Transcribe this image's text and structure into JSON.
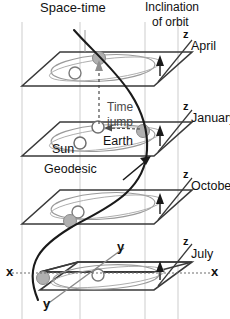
{
  "figure": {
    "background_color": "#ffffff",
    "ink_color": "#1a1a1a",
    "grid_color": "#c9c9c9",
    "orbit_color": "#8a8a8a",
    "body_fill": "#b3b3b3",
    "open_body_fill": "#ffffff"
  },
  "labels": {
    "spacetime": "Space-time",
    "time_axis": "t",
    "inclination_line1": "Inclination",
    "inclination_line2": "of orbit",
    "time_jump_line1": "Time",
    "time_jump_line2": "jump",
    "earth": "Earth",
    "sun": "Sun",
    "geodesic": "Geodesic"
  },
  "axes": {
    "z_april": "z",
    "z_january": "z",
    "z_october": "z",
    "z_july": "z",
    "x_left": "x",
    "x_right": "x",
    "y_upper": "y",
    "y_lower": "y"
  },
  "planes": [
    {
      "month": "April",
      "y_label": 42,
      "slab": false
    },
    {
      "month": "January",
      "y_label": 118,
      "slab": false
    },
    {
      "month": "October",
      "y_label": 185,
      "slab": false
    },
    {
      "month": "July",
      "y_label": 253,
      "slab": true
    }
  ],
  "bodies": {
    "sun_label": "Sun",
    "earth_label": "Earth",
    "sun_marker": "open-circle",
    "earth_marker": "filled-circle"
  },
  "markers": {
    "inclination_arrow": "up-triangle",
    "geodesic_arrow": "arrowhead",
    "time_jump_arrow": "dashed-arrow"
  }
}
